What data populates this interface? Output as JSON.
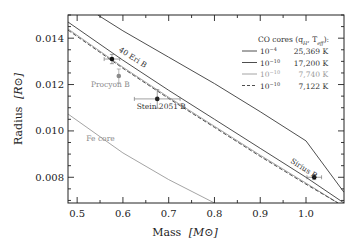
{
  "chart_data": {
    "type": "line",
    "title": "",
    "xlabel": "Mass [M⊙]",
    "ylabel": "Radius [R⊙]",
    "xlim": [
      0.48,
      1.083
    ],
    "ylim": [
      0.00689,
      0.015
    ],
    "x_ticks": [
      0.5,
      0.6,
      0.7,
      0.8,
      0.9,
      1.0
    ],
    "x_tick_labels": [
      "0.5",
      "0.6",
      "0.7",
      "0.8",
      "0.9",
      "1.0"
    ],
    "y_ticks": [
      0.008,
      0.01,
      0.012,
      0.014
    ],
    "y_tick_labels": [
      "0.008",
      "0.010",
      "0.012",
      "0.014"
    ],
    "grid": false,
    "legend": {
      "title": "CO cores (q_H, T_eff):",
      "position": "upper right",
      "entries": [
        {
          "qH": "10^-4",
          "teff": "25,369 K",
          "style": "solid",
          "color": "#3a3a3a"
        },
        {
          "qH": "10^-10",
          "teff": "17,200 K",
          "style": "solid",
          "color": "#3a3a3a"
        },
        {
          "qH": "10^-10",
          "teff": "7,740 K",
          "style": "solid",
          "color": "#9a9a9a"
        },
        {
          "qH": "10^-10",
          "teff": "7,122 K",
          "style": "dashed",
          "color": "#3a3a3a"
        }
      ]
    },
    "series": [
      {
        "name": "CO core qH=1e-4, 25,369 K",
        "style": "solid",
        "color": "#3a3a3a",
        "x": [
          0.545,
          0.6,
          0.7,
          0.8,
          0.9,
          1.0,
          1.083
        ],
        "y": [
          0.015,
          0.01432,
          0.01318,
          0.01204,
          0.01083,
          0.00957,
          0.00735
        ]
      },
      {
        "name": "CO core qH=1e-10, 17,200 K",
        "style": "solid",
        "color": "#3a3a3a",
        "x": [
          0.48,
          0.6,
          0.7,
          0.8,
          0.9,
          1.0,
          1.083
        ],
        "y": [
          0.0147,
          0.01305,
          0.01175,
          0.0105,
          0.00925,
          0.008,
          0.00689
        ]
      },
      {
        "name": "CO core qH=1e-10, 7,740 K",
        "style": "solid",
        "color": "#9a9a9a",
        "x": [
          0.48,
          0.6,
          0.7,
          0.8,
          0.9,
          1.0,
          1.07
        ],
        "y": [
          0.0144,
          0.01275,
          0.01145,
          0.0102,
          0.00895,
          0.00775,
          0.00689
        ]
      },
      {
        "name": "CO core qH=1e-10, 7,122 K",
        "style": "dashed",
        "color": "#3a3a3a",
        "x": [
          0.48,
          0.6,
          0.7,
          0.8,
          0.9,
          1.0,
          1.07
        ],
        "y": [
          0.01435,
          0.0127,
          0.0114,
          0.01015,
          0.0089,
          0.0077,
          0.00689
        ]
      },
      {
        "name": "Fe core",
        "style": "solid",
        "color": "#9a9a9a",
        "x": [
          0.48,
          0.6,
          0.7,
          0.8
        ],
        "y": [
          0.01073,
          0.00905,
          0.0079,
          0.00689
        ]
      }
    ],
    "points": [
      {
        "name": "40 Eri B",
        "mass": 0.576,
        "mass_err": 0.017,
        "radius": 0.0131,
        "radius_err": 0.0002,
        "color": "#111111"
      },
      {
        "name": "Procyon B",
        "mass": 0.591,
        "mass_err": 0.0,
        "radius": 0.01237,
        "radius_err": 0.0003,
        "color": "#8a8a8a"
      },
      {
        "name": "Stein 2051 B",
        "mass": 0.675,
        "mass_err": 0.05,
        "radius": 0.01138,
        "radius_err": 0.0004,
        "color": "#222222"
      },
      {
        "name": "Sirius B",
        "mass": 1.018,
        "mass_err": 0.016,
        "radius": 0.008,
        "radius_err": 0.0001,
        "color": "#111111"
      }
    ],
    "annotations": [
      {
        "text": "40 Eri B",
        "x": 0.59,
        "y": 0.01345,
        "rotation": 33
      },
      {
        "text": "Procyon B",
        "x": 0.53,
        "y": 0.0119
      },
      {
        "text": "Stein 2051 B",
        "x": 0.63,
        "y": 0.01095
      },
      {
        "text": "Sirius B",
        "x": 0.965,
        "y": 0.00865,
        "rotation": 33
      },
      {
        "text": "Fe core",
        "x": 0.52,
        "y": 0.00955
      }
    ]
  },
  "labels": {
    "xlabel_main": "Mass",
    "xlabel_unit": "[M⊙]",
    "ylabel_main": "Radius",
    "ylabel_unit": "[R⊙]",
    "legend_title": "CO cores (q",
    "legend_title_sub": "H",
    "legend_title_mid": ", T",
    "legend_title_sub2": "eff",
    "legend_title_end": "):"
  }
}
